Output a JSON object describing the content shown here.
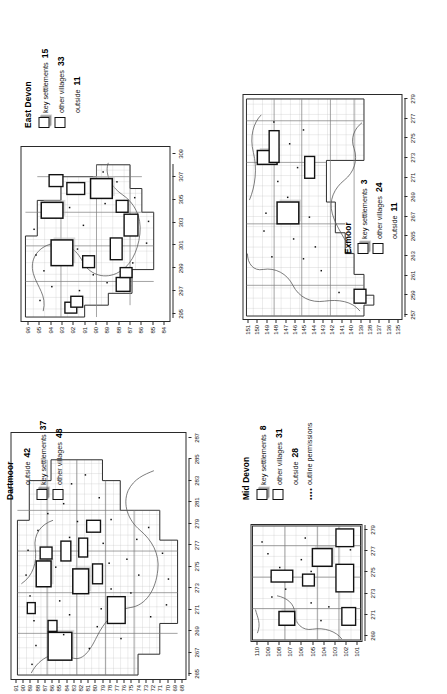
{
  "figure": {
    "orientation": "rotated-90-ccw",
    "panel_order": [
      "east_devon",
      "exmoor",
      "dartmoor",
      "mid_devon"
    ]
  },
  "panels": {
    "east_devon": {
      "title": "East Devon",
      "legend": [
        {
          "symbol": "shadowed-square",
          "label": "key settlements",
          "value": "15"
        },
        {
          "symbol": "plain-square",
          "label": "other villages",
          "value": "33"
        },
        {
          "symbol": "none",
          "label": "outside",
          "value": "11"
        }
      ],
      "axis_x": {
        "ticks": [
          "295",
          "297",
          "299",
          "301",
          "303",
          "305",
          "307",
          "309"
        ]
      },
      "axis_y": {
        "ticks": [
          "96",
          "95",
          "94",
          "93",
          "92",
          "91",
          "90",
          "89",
          "88",
          "87",
          "86",
          "85",
          "84"
        ]
      }
    },
    "exmoor": {
      "title": "Exmoor",
      "legend": [
        {
          "symbol": "shadowed-square",
          "label": "key settlements",
          "value": "3"
        },
        {
          "symbol": "plain-square",
          "label": "other villages",
          "value": "24"
        },
        {
          "symbol": "none",
          "label": "outside",
          "value": "11"
        }
      ],
      "axis_x": {
        "ticks": [
          "257",
          "259",
          "261",
          "263",
          "265",
          "267",
          "269",
          "271",
          "273",
          "275",
          "277",
          "279"
        ]
      },
      "axis_y": {
        "ticks": [
          "151",
          "150",
          "149",
          "148",
          "147",
          "146",
          "145",
          "144",
          "143",
          "142",
          "141",
          "140",
          "139",
          "138",
          "137",
          "136",
          "135"
        ]
      }
    },
    "dartmoor": {
      "title": "Dartmoor",
      "legend": [
        {
          "symbol": "none",
          "label": "outside",
          "value": "42"
        },
        {
          "symbol": "shadowed-square",
          "label": "key settlements",
          "value": "37"
        },
        {
          "symbol": "plain-square",
          "label": "other villages",
          "value": "48"
        }
      ],
      "axis_x": {
        "ticks": [
          "265",
          "267",
          "269",
          "271",
          "273",
          "275",
          "277",
          "279",
          "281",
          "283",
          "285",
          "287"
        ]
      },
      "axis_y": {
        "ticks": [
          "91",
          "90",
          "89",
          "88",
          "87",
          "86",
          "85",
          "84",
          "83",
          "82",
          "81",
          "80",
          "79",
          "78",
          "77",
          "76",
          "75",
          "74",
          "73",
          "72",
          "71",
          "70",
          "69",
          "68"
        ]
      }
    },
    "mid_devon": {
      "title": "Mid Devon",
      "legend": [
        {
          "symbol": "shadowed-square",
          "label": "key settlements",
          "value": "8"
        },
        {
          "symbol": "plain-square",
          "label": "other villages",
          "value": "31"
        },
        {
          "symbol": "none",
          "label": "outside",
          "value": "28"
        },
        {
          "symbol": "dotted",
          "label": "outline permissions",
          "value": ""
        }
      ],
      "axis_x": {
        "ticks": [
          "269",
          "271",
          "273",
          "275",
          "277",
          "279"
        ]
      },
      "axis_y": {
        "ticks": [
          "110",
          "109",
          "108",
          "107",
          "106",
          "105",
          "104",
          "103",
          "102",
          "101"
        ]
      }
    }
  },
  "colors": {
    "ink": "#1a1a1a",
    "grid_minor": "#b9b9b9",
    "grid_major": "#6f6f6f",
    "outline": "#4a4a4a",
    "shadow": "#9a9a9a",
    "paper": "#ffffff"
  },
  "chart_data": {
    "type": "map",
    "units": "counts of planning sites",
    "districts": [
      {
        "name": "East Devon",
        "key_settlements": 15,
        "other_villages": 33,
        "outside": 11,
        "x_range": [
          295,
          310
        ],
        "y_range": [
          84,
          96
        ]
      },
      {
        "name": "Exmoor",
        "key_settlements": 3,
        "other_villages": 24,
        "outside": 11,
        "x_range": [
          257,
          280
        ],
        "y_range": [
          135,
          151
        ]
      },
      {
        "name": "Dartmoor",
        "key_settlements": 37,
        "other_villages": 48,
        "outside": 42,
        "x_range": [
          265,
          288
        ],
        "y_range": [
          68,
          91
        ]
      },
      {
        "name": "Mid Devon",
        "key_settlements": 8,
        "other_villages": 31,
        "outside": 28,
        "x_range": [
          269,
          280
        ],
        "y_range": [
          101,
          110
        ]
      }
    ],
    "legend_symbols": [
      {
        "id": "shadowed-square",
        "means": "key settlements"
      },
      {
        "id": "plain-square",
        "means": "other villages"
      },
      {
        "id": "dots",
        "means": "outline permissions"
      }
    ]
  }
}
